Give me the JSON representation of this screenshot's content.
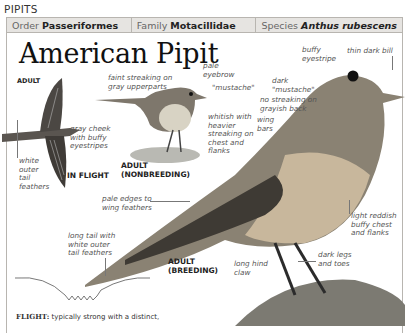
{
  "section": "PIPITS",
  "taxonomy": {
    "order_label": "Order",
    "order_value": "Passeriformes",
    "family_label": "Family",
    "family_value": "Motacillidae",
    "species_label": "Species",
    "species_value": "Anthus rubescens"
  },
  "title": "American Pipit",
  "figures": {
    "adult_label": "ADULT",
    "in_flight": "IN FLIGHT",
    "nonbreeding_1": "ADULT",
    "nonbreeding_2": "(NONBREEDING)",
    "breeding_1": "ADULT",
    "breeding_2": "(BREEDING)"
  },
  "annotations": {
    "faint_streaking": [
      "faint streaking on",
      "gray upperparts"
    ],
    "pale_eyebrow": [
      "pale",
      "eyebrow"
    ],
    "mustache_small": "\"mustache\"",
    "gray_cheek": [
      "gray cheek",
      "with buffy",
      "eyestripes"
    ],
    "white_outer": [
      "white",
      "outer",
      "tail",
      "feathers"
    ],
    "whitish": [
      "whitish with",
      "heavier",
      "streaking on",
      "chest and",
      "flanks"
    ],
    "buffy_eyestripe": [
      "buffy",
      "eyestripe"
    ],
    "thin_bill": "thin dark bill",
    "dark_mustache": [
      "dark",
      "\"mustache\""
    ],
    "no_streaking": [
      "no streaking on",
      "grayish back"
    ],
    "wing_bars": [
      "wing",
      "bars"
    ],
    "pale_edges": [
      "pale edges to",
      "wing feathers"
    ],
    "reddish": [
      "light reddish",
      "buffy chest",
      "and flanks"
    ],
    "long_tail": [
      "long tail with",
      "white outer",
      "tail feathers"
    ],
    "dark_legs": [
      "dark legs",
      "and toes"
    ],
    "hind_claw": [
      "long hind",
      "claw"
    ]
  },
  "flight": {
    "label": "FLIGHT:",
    "text": "typically strong with a distinct,"
  }
}
